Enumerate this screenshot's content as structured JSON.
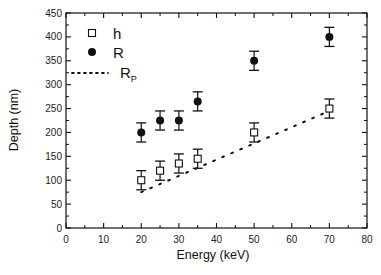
{
  "chart_data": {
    "type": "scatter",
    "title": "",
    "xlabel": "Energy (keV)",
    "ylabel": "Depth (nm)",
    "xlim": [
      0,
      80
    ],
    "ylim": [
      0,
      450
    ],
    "x_ticks": [
      0,
      10,
      20,
      30,
      40,
      50,
      60,
      70,
      80
    ],
    "y_ticks": [
      0,
      50,
      100,
      150,
      200,
      250,
      300,
      350,
      400,
      450
    ],
    "grid": false,
    "legend_position": "upper-left",
    "series": [
      {
        "name": "h",
        "marker": "open-square",
        "x": [
          20,
          25,
          30,
          35,
          50,
          70
        ],
        "y": [
          100,
          120,
          135,
          145,
          200,
          250
        ],
        "error": [
          20,
          20,
          20,
          20,
          20,
          20
        ]
      },
      {
        "name": "R",
        "marker": "filled-circle",
        "x": [
          20,
          25,
          30,
          35,
          50,
          70
        ],
        "y": [
          200,
          225,
          225,
          265,
          350,
          400
        ],
        "error": [
          20,
          20,
          20,
          20,
          20,
          20
        ]
      },
      {
        "name": "R_P",
        "style": "dotted-line",
        "x": [
          20,
          70
        ],
        "y": [
          75,
          245
        ]
      }
    ]
  },
  "legend": {
    "h_label": "h",
    "r_label": "R",
    "rp_label": "R",
    "rp_sub": "P"
  },
  "axes": {
    "xlabel": "Energy (keV)",
    "ylabel": "Depth (nm)"
  }
}
